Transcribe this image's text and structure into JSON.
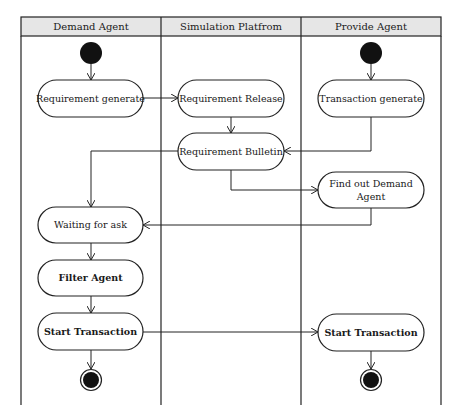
{
  "diagram": {
    "type": "UML activity diagram (swimlanes)",
    "lanes": [
      {
        "id": "demand",
        "title": "Demand Agent"
      },
      {
        "id": "platform",
        "title": "Simulation Platfrom"
      },
      {
        "id": "provide",
        "title": "Provide Agent"
      }
    ],
    "nodes": {
      "req_generate": {
        "label": "Requirement generate",
        "lane": "demand"
      },
      "req_release": {
        "label": "Requirement Release",
        "lane": "platform"
      },
      "trans_generate": {
        "label": "Transaction generate",
        "lane": "provide"
      },
      "req_bulletin": {
        "label": "Requirement Bulletin",
        "lane": "platform"
      },
      "find_demand": {
        "label_line1": "Find out Demand",
        "label_line2": "Agent",
        "lane": "provide"
      },
      "waiting": {
        "label": "Waiting for ask",
        "lane": "demand"
      },
      "filter": {
        "label": "Filter Agent",
        "lane": "demand"
      },
      "start_left": {
        "label": "Start Transaction",
        "lane": "demand"
      },
      "start_right": {
        "label": "Start Transaction",
        "lane": "provide"
      }
    },
    "edges": [
      {
        "from": "start_demand",
        "to": "req_generate"
      },
      {
        "from": "req_generate",
        "to": "req_release"
      },
      {
        "from": "req_release",
        "to": "req_bulletin"
      },
      {
        "from": "start_provide",
        "to": "trans_generate"
      },
      {
        "from": "trans_generate",
        "to": "req_bulletin"
      },
      {
        "from": "req_bulletin",
        "to": "waiting"
      },
      {
        "from": "req_bulletin",
        "to": "find_demand"
      },
      {
        "from": "find_demand",
        "to": "waiting"
      },
      {
        "from": "waiting",
        "to": "filter"
      },
      {
        "from": "filter",
        "to": "start_left"
      },
      {
        "from": "start_left",
        "to": "start_right"
      },
      {
        "from": "start_left",
        "to": "end_demand"
      },
      {
        "from": "start_right",
        "to": "end_provide"
      }
    ],
    "colors": {
      "header_bg": "#e6e6e6",
      "line": "#222222",
      "node_fill": "#ffffff"
    }
  }
}
